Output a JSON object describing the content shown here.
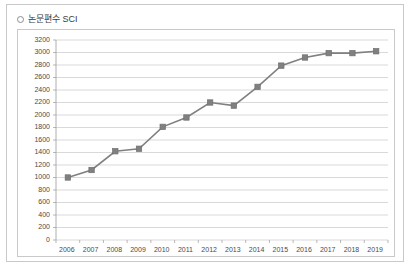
{
  "legend": {
    "marker_icon": "circle-marker-icon",
    "label": "논문편수 SCI"
  },
  "chart_data": {
    "type": "line",
    "title": "",
    "subtitle": "",
    "xlabel": "",
    "ylabel": "",
    "grid": true,
    "legend_position": "top-left",
    "categories": [
      "2006",
      "2007",
      "2008",
      "2009",
      "2010",
      "2011",
      "2012",
      "2013",
      "2014",
      "2015",
      "2016",
      "2017",
      "2018",
      "2019"
    ],
    "series": [
      {
        "name": "논문편수 SCI",
        "values": [
          1000,
          1120,
          1420,
          1460,
          1810,
          1960,
          2200,
          2150,
          2450,
          2790,
          2920,
          2990,
          2990,
          3020
        ],
        "color": "#808080",
        "marker": "square"
      }
    ],
    "ylim": [
      0,
      3200
    ],
    "ytick_step": 200,
    "ytick_labels": [
      "3200",
      "3000",
      "2800",
      "2600",
      "2400",
      "2200",
      "2000",
      "1800",
      "1600",
      "1400",
      "1200",
      "1000",
      "800",
      "600",
      "400",
      "200",
      "0"
    ]
  }
}
